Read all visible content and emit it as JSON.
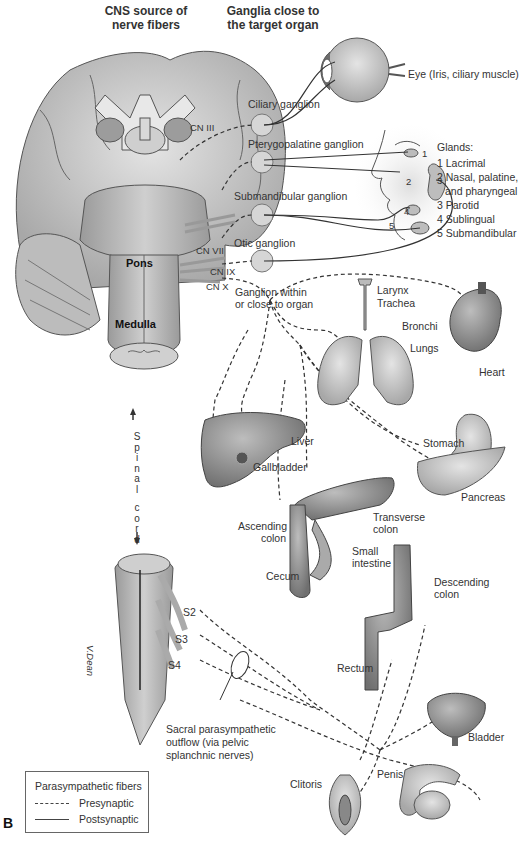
{
  "figure": {
    "panel_letter": "B",
    "headers": {
      "cns_source": [
        "CNS source of",
        "nerve fibers"
      ],
      "ganglia": [
        "Ganglia close to",
        "the target organ"
      ]
    },
    "brain_regions": {
      "pons": "Pons",
      "medulla": "Medulla",
      "spinal_cord": [
        "S",
        "p",
        "i",
        "n",
        "a",
        "l",
        "",
        "c",
        "o",
        "r",
        "d"
      ]
    },
    "cranial_nerves": {
      "cn3": "CN III",
      "cn7": "CN VII",
      "cn9": "CN IX",
      "cn10": "CN X"
    },
    "ganglia": {
      "ciliary": "Ciliary ganglion",
      "pterygopalatine": "Pterygopalatine ganglion",
      "submandibular": "Submandibular ganglion",
      "otic": "Otic ganglion",
      "within_organ": [
        "Ganglion within",
        "or close to organ"
      ]
    },
    "eye_label": "Eye (Iris, ciliary muscle)",
    "glands": {
      "title": "Glands:",
      "items": [
        "1 Lacrimal",
        "2 Nasal, palatine,",
        "and pharyngeal",
        "3 Parotid",
        "4 Sublingual",
        "5 Submandibular"
      ],
      "face_numbers": [
        "1",
        "2",
        "3",
        "4",
        "5"
      ]
    },
    "organs": {
      "larynx": "Larynx",
      "trachea": "Trachea",
      "bronchi": "Bronchi",
      "lungs": "Lungs",
      "heart": "Heart",
      "liver": "Liver",
      "gallbladder": "Gallbladder",
      "stomach": "Stomach",
      "pancreas": "Pancreas",
      "transverse_colon": [
        "Transverse",
        "colon"
      ],
      "ascending_colon": [
        "Ascending",
        "colon"
      ],
      "small_intestine": [
        "Small",
        "intestine"
      ],
      "cecum": "Cecum",
      "descending_colon": [
        "Descending",
        "colon"
      ],
      "rectum": "Rectum",
      "bladder": "Bladder",
      "clitoris": "Clitoris",
      "penis": "Penis"
    },
    "sacral": {
      "s2": "S2",
      "s3": "S3",
      "s4": "S4",
      "outflow": [
        "Sacral parasympathetic",
        "outflow (via pelvic",
        "splanchnic nerves)"
      ],
      "signature": "V.Dean"
    },
    "legend": {
      "title": "Parasympathetic fibers",
      "presynaptic": "Presynaptic",
      "postsynaptic": "Postsynaptic"
    },
    "colors": {
      "tissue": "#b8b8b8",
      "tissue_dark": "#8a8a8a",
      "tissue_light": "#dcdcdc",
      "line": "#333333"
    }
  }
}
